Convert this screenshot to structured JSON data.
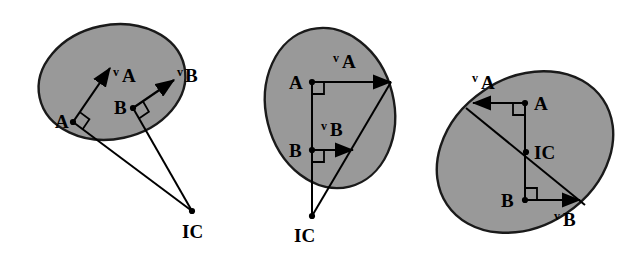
{
  "figure": {
    "background_color": "#ffffff",
    "body_fill_color": "#999999",
    "outline_color": "#1a1a1a",
    "line_color": "#000000",
    "panel_count": 3
  },
  "panels": [
    {
      "id": "panel-1",
      "name": "general-planar-motion",
      "body": {
        "shape": "ellipse",
        "cx": 112,
        "cy": 82,
        "rx": 74,
        "ry": 57,
        "rotation_deg": -12
      },
      "points": [
        {
          "id": "A",
          "label": "A",
          "x": 73,
          "y": 122,
          "label_x": 55,
          "label_y": 128
        },
        {
          "id": "B",
          "label": "B",
          "x": 133,
          "y": 108,
          "label_x": 114,
          "label_y": 114
        },
        {
          "id": "IC",
          "label": "IC",
          "x": 192,
          "y": 211,
          "label_x": 182,
          "label_y": 238
        }
      ],
      "vectors": [
        {
          "id": "vA",
          "prefix": "v",
          "subscript": "A",
          "from_x": 73,
          "from_y": 122,
          "to_x": 110,
          "to_y": 68,
          "label_x": 113,
          "label_y": 76,
          "sub_x": 122,
          "sub_y": 82
        },
        {
          "id": "vB",
          "prefix": "v",
          "subscript": "B",
          "from_x": 133,
          "from_y": 108,
          "to_x": 174,
          "to_y": 80,
          "label_x": 177,
          "label_y": 76,
          "sub_x": 185,
          "sub_y": 82
        }
      ],
      "radii": [
        {
          "from_x": 73,
          "from_y": 122,
          "to_x": 192,
          "to_y": 211
        },
        {
          "from_x": 133,
          "from_y": 108,
          "to_x": 192,
          "to_y": 211
        }
      ],
      "right_angles": [
        {
          "vertex_x": 73,
          "vertex_y": 122,
          "dir1_x": 110,
          "dir1_y": 68,
          "dir2_x": 192,
          "dir2_y": 211,
          "size": 12
        },
        {
          "vertex_x": 133,
          "vertex_y": 108,
          "dir1_x": 174,
          "dir1_y": 80,
          "dir2_x": 192,
          "dir2_y": 211,
          "size": 12
        }
      ]
    },
    {
      "id": "panel-2",
      "name": "parallel-velocities-ic-outside",
      "body": {
        "shape": "ellipse",
        "cx": 330,
        "cy": 108,
        "rx": 64,
        "ry": 81,
        "rotation_deg": -14
      },
      "points": [
        {
          "id": "A",
          "label": "A",
          "x": 312,
          "y": 82,
          "label_x": 289,
          "label_y": 89
        },
        {
          "id": "B",
          "label": "B",
          "x": 312,
          "y": 150,
          "label_x": 289,
          "label_y": 157
        },
        {
          "id": "IC",
          "label": "IC",
          "x": 312,
          "y": 216,
          "label_x": 294,
          "label_y": 242
        }
      ],
      "vectors": [
        {
          "id": "vA",
          "prefix": "v",
          "subscript": "A",
          "from_x": 312,
          "from_y": 82,
          "to_x": 391,
          "to_y": 82,
          "label_x": 333,
          "label_y": 62,
          "sub_x": 342,
          "sub_y": 68
        },
        {
          "id": "vB",
          "prefix": "v",
          "subscript": "B",
          "from_x": 312,
          "from_y": 150,
          "to_x": 353,
          "to_y": 150,
          "label_x": 321,
          "label_y": 130,
          "sub_x": 330,
          "sub_y": 136
        }
      ],
      "radii": [
        {
          "from_x": 312,
          "from_y": 82,
          "to_x": 312,
          "to_y": 216
        },
        {
          "from_x": 391,
          "from_y": 82,
          "to_x": 312,
          "to_y": 216
        }
      ],
      "right_angles": [
        {
          "vertex_x": 312,
          "vertex_y": 82,
          "dir1_x": 391,
          "dir1_y": 82,
          "dir2_x": 312,
          "dir2_y": 216,
          "size": 12
        },
        {
          "vertex_x": 312,
          "vertex_y": 150,
          "dir1_x": 353,
          "dir1_y": 150,
          "dir2_x": 312,
          "dir2_y": 216,
          "size": 12
        }
      ]
    },
    {
      "id": "panel-3",
      "name": "opposite-velocities-ic-inside",
      "body": {
        "shape": "ellipse",
        "cx": 525,
        "cy": 152,
        "rx": 94,
        "ry": 74,
        "rotation_deg": -34
      },
      "points": [
        {
          "id": "A",
          "label": "A",
          "x": 525,
          "y": 103,
          "label_x": 534,
          "label_y": 110
        },
        {
          "id": "B",
          "label": "B",
          "x": 525,
          "y": 200,
          "label_x": 501,
          "label_y": 207
        },
        {
          "id": "IC",
          "label": "IC",
          "x": 526,
          "y": 152,
          "label_x": 534,
          "label_y": 159
        }
      ],
      "vectors": [
        {
          "id": "vA",
          "prefix": "v",
          "subscript": "A",
          "from_x": 525,
          "from_y": 103,
          "to_x": 473,
          "to_y": 103,
          "label_x": 472,
          "label_y": 82,
          "sub_x": 481,
          "sub_y": 89
        },
        {
          "id": "vB",
          "prefix": "v",
          "subscript": "B",
          "from_x": 525,
          "from_y": 200,
          "to_x": 580,
          "to_y": 200,
          "label_x": 554,
          "label_y": 220,
          "sub_x": 563,
          "sub_y": 226
        }
      ],
      "radii": [
        {
          "from_x": 525,
          "from_y": 103,
          "to_x": 525,
          "to_y": 200
        },
        {
          "from_x": 466,
          "from_y": 108,
          "to_x": 585,
          "to_y": 205
        }
      ],
      "right_angles": [
        {
          "vertex_x": 525,
          "vertex_y": 103,
          "dir1_x": 473,
          "dir1_y": 103,
          "dir2_x": 525,
          "dir2_y": 200,
          "size": 12
        },
        {
          "vertex_x": 525,
          "vertex_y": 200,
          "dir1_x": 580,
          "dir1_y": 200,
          "dir2_x": 525,
          "dir2_y": 103,
          "size": 12
        }
      ]
    }
  ]
}
